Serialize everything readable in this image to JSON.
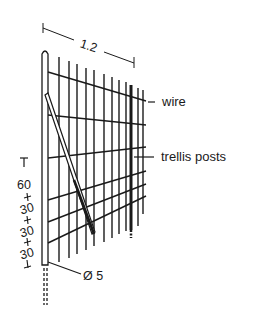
{
  "diagram": {
    "type": "technical-drawing",
    "colors": {
      "ink": "#1a1a1a",
      "background": "#ffffff"
    },
    "dimensions": {
      "width": "1.2",
      "top_spacing": "60",
      "spacing_1": "30",
      "spacing_2": "30",
      "spacing_3": "30",
      "post_diameter": "Ø 5"
    },
    "labels": {
      "wire": "wire",
      "trellis_posts": "trellis posts"
    }
  }
}
